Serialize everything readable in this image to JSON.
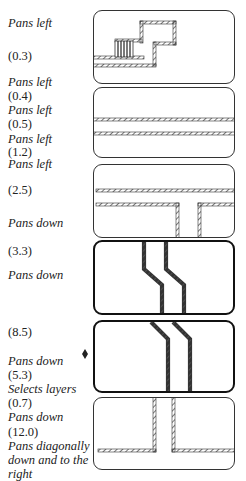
{
  "labels": [
    {
      "text": "Pans left",
      "italic": true,
      "y": 16
    },
    {
      "text": "(0.3)",
      "italic": false,
      "y": 49
    },
    {
      "text": "Pans left",
      "italic": true,
      "y": 75
    },
    {
      "text": "(0.4)",
      "italic": false,
      "y": 89
    },
    {
      "text": "Pans left",
      "italic": true,
      "y": 103
    },
    {
      "text": "(0.5)",
      "italic": false,
      "y": 117
    },
    {
      "text": "Pans left",
      "italic": true,
      "y": 132
    },
    {
      "text": "(1.2)",
      "italic": false,
      "y": 145
    },
    {
      "text": "Pans left",
      "italic": true,
      "y": 157
    },
    {
      "text": "(2.5)",
      "italic": false,
      "y": 183
    },
    {
      "text": "Pans down",
      "italic": true,
      "y": 216
    },
    {
      "text": "(3.3)",
      "italic": false,
      "y": 244
    },
    {
      "text": "Pans down",
      "italic": true,
      "y": 268
    },
    {
      "text": "(8.5)",
      "italic": false,
      "y": 325
    },
    {
      "text": "Pans down",
      "italic": true,
      "y": 354
    },
    {
      "text": "(5.3)",
      "italic": false,
      "y": 368
    },
    {
      "text": "Selects layers",
      "italic": true,
      "y": 382
    },
    {
      "text": "(0.7)",
      "italic": false,
      "y": 396
    },
    {
      "text": "Pans down",
      "italic": true,
      "y": 410
    },
    {
      "text": "(12.0)",
      "italic": false,
      "y": 425
    },
    {
      "text": "Pans diagonally",
      "italic": true,
      "y": 439
    },
    {
      "text": "down and to the",
      "italic": true,
      "y": 453
    },
    {
      "text": "right",
      "italic": true,
      "y": 467
    }
  ],
  "panels": [
    {
      "id": "panel-1",
      "top": 10,
      "height": 74,
      "bold": false,
      "content": "staircase traces with layer-selection hatch block"
    },
    {
      "id": "panel-2",
      "top": 87,
      "height": 71,
      "bold": false,
      "content": "two horizontal parallel traces"
    },
    {
      "id": "panel-3",
      "top": 164,
      "height": 74,
      "bold": false,
      "content": "horizontal traces with T-junction downward"
    },
    {
      "id": "panel-4",
      "top": 240,
      "height": 75,
      "bold": true,
      "content": "two vertical traces jogging diagonally"
    },
    {
      "id": "panel-5",
      "top": 320,
      "height": 73,
      "bold": true,
      "content": "two traces descending diagonally then vertical"
    },
    {
      "id": "panel-6",
      "top": 397,
      "height": 73,
      "bold": false,
      "content": "vertical traces turning into horizontal traces"
    }
  ],
  "marker": {
    "name": "current-step-marker",
    "symbol": "diamond"
  },
  "colors": {
    "stroke": "#333333",
    "hatch": "#555555",
    "background": "#ffffff"
  }
}
